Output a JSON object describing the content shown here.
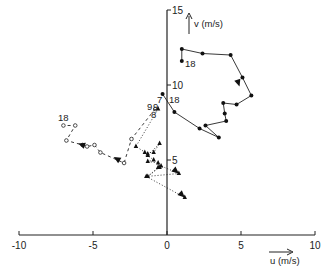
{
  "chart_data": {
    "type": "line",
    "title": "",
    "xlabel": "u (m/s)",
    "ylabel": "v (m/s)",
    "xlim": [
      -10,
      10
    ],
    "ylim": [
      0,
      15
    ],
    "x_ticks": [
      -10,
      -5,
      0,
      5,
      10
    ],
    "x_tick_labels": [
      "-10",
      "-5",
      "0",
      "5",
      "10"
    ],
    "y_ticks": [
      5,
      10,
      15
    ],
    "y_tick_labels": [
      "5",
      "10",
      "15"
    ],
    "grid": false,
    "legend": "none",
    "series": [
      {
        "name": "solid-dots",
        "line_style": "solid",
        "marker": "filled-circle",
        "points": [
          [
            -0.3,
            9.4
          ],
          [
            0.5,
            8.2
          ],
          [
            2.2,
            7.1
          ],
          [
            3.5,
            6.5
          ],
          [
            2.6,
            7.3
          ],
          [
            4.0,
            7.6
          ],
          [
            3.9,
            8.1
          ],
          [
            3.8,
            8.8
          ],
          [
            4.7,
            8.7
          ],
          [
            5.7,
            9.3
          ],
          [
            5.1,
            10.5
          ],
          [
            4.3,
            12.0
          ],
          [
            2.4,
            12.1
          ],
          [
            1.0,
            12.4
          ],
          [
            1.0,
            11.6
          ]
        ],
        "arrow_at": [
          4.9,
          9.9
        ],
        "start_label": "7",
        "end_label": "18"
      },
      {
        "name": "dashed-open-circles",
        "line_style": "dashed",
        "marker": "open-circle",
        "points": [
          [
            -0.8,
            8.4
          ],
          [
            -2.4,
            6.4
          ],
          [
            -2.9,
            4.8
          ],
          [
            -4.5,
            5.5
          ],
          [
            -4.9,
            6.0
          ],
          [
            -5.4,
            5.9
          ],
          [
            -5.7,
            6.0
          ],
          [
            -6.8,
            6.3
          ],
          [
            -6.2,
            7.3
          ],
          [
            -7.0,
            7.3
          ]
        ],
        "arrow_at": [
          -3.6,
          5.2
        ],
        "arrow2_at": [
          -6.0,
          6.1
        ],
        "start_label": "9",
        "end_label": "18"
      },
      {
        "name": "dotted-triangles",
        "line_style": "dotted",
        "marker": "filled-triangle",
        "points": [
          [
            -0.6,
            8.4
          ],
          [
            -2.1,
            5.9
          ],
          [
            -1.3,
            5.4
          ],
          [
            -1.5,
            5.5
          ],
          [
            -0.9,
            5.5
          ],
          [
            -0.5,
            6.1
          ],
          [
            -1.3,
            5.3
          ],
          [
            -0.9,
            5.0
          ],
          [
            -1.3,
            4.9
          ],
          [
            -0.6,
            4.8
          ],
          [
            -0.5,
            4.5
          ],
          [
            -0.6,
            4.5
          ],
          [
            -1.3,
            3.9
          ],
          [
            -0.4,
            4.6
          ],
          [
            0.8,
            4.1
          ],
          [
            -1.4,
            3.9
          ],
          [
            1.2,
            2.5
          ]
        ],
        "start_label": "9",
        "secondary_labels": [
          "8",
          "6"
        ]
      }
    ],
    "annotations": [
      "7",
      "9",
      "9",
      "8",
      "6",
      "18",
      "18",
      "18"
    ]
  }
}
